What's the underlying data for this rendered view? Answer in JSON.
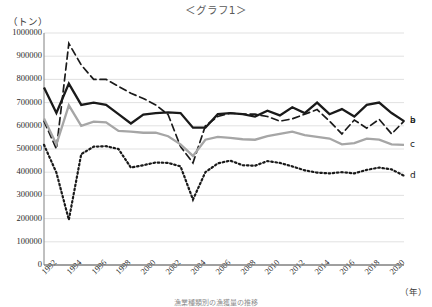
{
  "title": "＜グラフ1＞",
  "axis": {
    "y_unit": "（トン）",
    "x_unit": "（年）"
  },
  "caption": "漁業種類別の漁獲量の推移",
  "series_labels": {
    "a": "a",
    "b": "b",
    "c": "c",
    "d": "d"
  },
  "chart_data": {
    "type": "line",
    "title": "＜グラフ1＞",
    "xlabel": "（年）",
    "ylabel": "（トン）",
    "ylim": [
      0,
      1000000
    ],
    "xlim": [
      1992,
      2021
    ],
    "grid": true,
    "legend_position": "right-inline",
    "ytick_labels": [
      "0",
      "100000",
      "200000",
      "300000",
      "400000",
      "500000",
      "600000",
      "700000",
      "800000",
      "900000",
      "1000000"
    ],
    "ytick_values": [
      0,
      100000,
      200000,
      300000,
      400000,
      500000,
      600000,
      700000,
      800000,
      900000,
      1000000
    ],
    "xtick_labels": [
      "1992",
      "1994",
      "1996",
      "1998",
      "2000",
      "2002",
      "2004",
      "2006",
      "2008",
      "2010",
      "2012",
      "2014",
      "2016",
      "2018",
      "2020"
    ],
    "xtick_values": [
      1992,
      1994,
      1996,
      1998,
      2000,
      2002,
      2004,
      2006,
      2008,
      2010,
      2012,
      2014,
      2016,
      2018,
      2020
    ],
    "x": [
      1992,
      1993,
      1994,
      1995,
      1996,
      1997,
      1998,
      1999,
      2000,
      2001,
      2002,
      2003,
      2004,
      2005,
      2006,
      2007,
      2008,
      2009,
      2010,
      2011,
      2012,
      2013,
      2014,
      2015,
      2016,
      2017,
      2018,
      2019,
      2020,
      2021
    ],
    "series": [
      {
        "name": "a",
        "style": "solid-thick",
        "color": "#1a1a1a",
        "values": [
          765000,
          655000,
          782000,
          690000,
          700000,
          690000,
          650000,
          610000,
          648000,
          655000,
          658000,
          655000,
          592000,
          592000,
          650000,
          655000,
          650000,
          640000,
          665000,
          645000,
          680000,
          655000,
          700000,
          650000,
          672000,
          640000,
          690000,
          700000,
          655000,
          620000
        ]
      },
      {
        "name": "b",
        "style": "dashed",
        "color": "#1a1a1a",
        "values": [
          620000,
          500000,
          955000,
          862000,
          800000,
          800000,
          770000,
          740000,
          718000,
          690000,
          648000,
          510000,
          440000,
          600000,
          640000,
          655000,
          650000,
          650000,
          640000,
          620000,
          630000,
          650000,
          670000,
          620000,
          565000,
          625000,
          590000,
          628000,
          565000,
          620000
        ]
      },
      {
        "name": "c",
        "style": "solid-thick",
        "color": "#a6a6a6",
        "values": [
          632000,
          520000,
          688000,
          600000,
          618000,
          615000,
          578000,
          575000,
          570000,
          570000,
          555000,
          520000,
          470000,
          540000,
          552000,
          548000,
          542000,
          540000,
          555000,
          565000,
          575000,
          560000,
          552000,
          545000,
          520000,
          525000,
          545000,
          540000,
          520000,
          518000
        ]
      },
      {
        "name": "d",
        "style": "dotted",
        "color": "#1a1a1a",
        "values": [
          518000,
          398000,
          195000,
          478000,
          510000,
          512000,
          500000,
          420000,
          430000,
          442000,
          440000,
          425000,
          282000,
          400000,
          438000,
          450000,
          430000,
          428000,
          448000,
          440000,
          425000,
          408000,
          398000,
          395000,
          400000,
          395000,
          410000,
          420000,
          412000,
          385000
        ]
      }
    ]
  }
}
